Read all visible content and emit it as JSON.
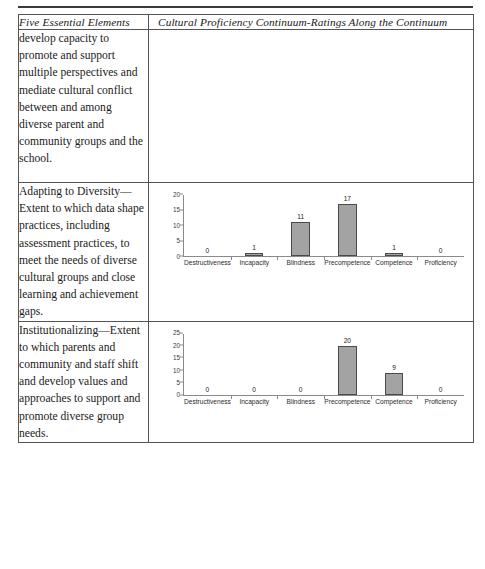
{
  "table": {
    "headers": {
      "left": "Five Essential Elements",
      "right": "Cultural Proficiency Continuum-Ratings Along the Continuum"
    },
    "rows": [
      {
        "description": "develop capacity to promote and support multiple perspectives and mediate cultural conflict between and among diverse parent and community groups and the school.",
        "has_chart": false
      },
      {
        "description": "Adapting to Diversity—Extent to which data shape practices, including assessment practices, to meet the needs of diverse cultural groups and close learning and achievement gaps.",
        "has_chart": true,
        "chart_index": 0
      },
      {
        "description": "Institutionalizing—Extent to which parents and community and staff shift and develop values and approaches to support and promote diverse group needs.",
        "has_chart": true,
        "chart_index": 1
      }
    ]
  },
  "chart_data": [
    {
      "type": "bar",
      "title": "",
      "xlabel": "",
      "ylabel": "",
      "categories": [
        "Destructiveness",
        "Incapacity",
        "Blindness",
        "Precompetence",
        "Competence",
        "Proficiency"
      ],
      "values": [
        0,
        1,
        11,
        17,
        1,
        0
      ],
      "yticks": [
        0,
        5,
        10,
        15,
        20
      ],
      "ylim": [
        0,
        20
      ],
      "grid": false,
      "legend": false,
      "bar_color": "#a3a3a3",
      "bar_border_color": "#4a4a4a"
    },
    {
      "type": "bar",
      "title": "",
      "xlabel": "",
      "ylabel": "",
      "categories": [
        "Destructiveness",
        "Incapacity",
        "Blindness",
        "Precompetence",
        "Competence",
        "Proficiency"
      ],
      "values": [
        0,
        0,
        0,
        20,
        9,
        0
      ],
      "yticks": [
        0,
        5,
        10,
        15,
        20,
        25
      ],
      "ylim": [
        0,
        25
      ],
      "grid": false,
      "legend": false,
      "bar_color": "#a3a3a3",
      "bar_border_color": "#4a4a4a"
    }
  ]
}
